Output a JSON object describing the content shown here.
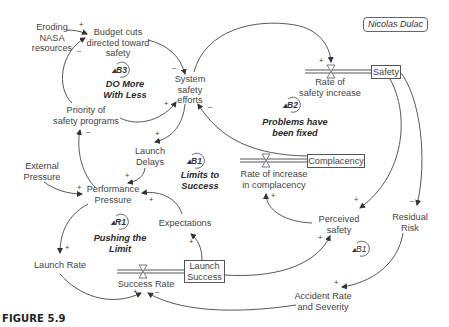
{
  "figure": {
    "caption": "FIGURE 5.9",
    "author": "Nicolas Dulac"
  },
  "variables": {
    "eroding_nasa": "Eroding\nNASA\nresources",
    "budget_cuts": "Budget cuts\ndirected toward\nsafety",
    "system_safety_efforts": "System\nsafety\nefforts",
    "priority_safety": "Priority of\nsafety programs",
    "launch_delays": "Launch\nDelays",
    "external_pressure": "External\nPressure",
    "performance_pressure": "Performance\nPressure",
    "expectations": "Expectations",
    "launch_rate": "Launch Rate",
    "success_rate": "Success Rate",
    "rate_safety_increase": "Rate of\nsafety increase",
    "rate_complacency": "Rate of increase\nin complacency",
    "perceived_safety": "Perceived\nsafety",
    "residual_risk": "Residual\nRisk",
    "accident_rate": "Accident Rate\nand Severity"
  },
  "stocks": {
    "safety": "Safety",
    "complacency": "Complacency",
    "launch_success": "Launch\nSuccess"
  },
  "loops": [
    {
      "id": "B3",
      "name": "DO More\nWith Less"
    },
    {
      "id": "B1",
      "name": "Limits to\nSuccess"
    },
    {
      "id": "R1",
      "name": "Pushing the\nLimit"
    },
    {
      "id": "B2",
      "name": "Problems have\nbeen fixed"
    },
    {
      "id": "B1",
      "name": ""
    }
  ],
  "polarities": {
    "eroding_to_budget": "+",
    "priority_to_budget": "–",
    "budget_to_sse": "–",
    "priority_to_sse": "+",
    "complacency_to_sse": "–",
    "sse_to_delays": "+",
    "sse_to_rate_safety": "+",
    "perf_to_priority": "–",
    "delays_to_perf": "+",
    "external_to_perf": "+",
    "expect_to_perf": "+",
    "perf_to_launchrate": "+",
    "launchsuccess_to_expect": "+",
    "launchrate_to_success": "+",
    "accident_to_success": "–",
    "safety_to_perceived": "+",
    "safety_to_residual": "–",
    "perceived_to_complacency": "+",
    "launchsuccess_to_perceived": "+",
    "residual_to_accident": "+"
  }
}
